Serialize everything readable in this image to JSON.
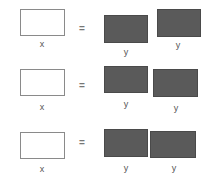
{
  "rows": [
    {
      "left_label": "x",
      "equals": "=",
      "right_labels": [
        "y",
        "y"
      ]
    },
    {
      "left_label": "x",
      "equals": "=",
      "right_labels": [
        "y",
        "y"
      ]
    },
    {
      "left_label": "x",
      "equals": "=",
      "right_labels": [
        "y",
        "y"
      ]
    }
  ],
  "colors": {
    "white_box_fill": "#ffffff",
    "white_box_border": "#8a8a8a",
    "dark_box_fill": "#5a5a5a"
  }
}
